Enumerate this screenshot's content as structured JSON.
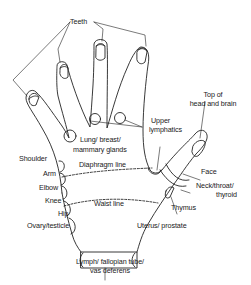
{
  "diagram": {
    "stroke_color": "#222222",
    "background": "#ffffff",
    "labels": {
      "teeth": "Teeth",
      "top_head_1": "Top of",
      "top_head_2": "head and brain",
      "upper_lymph_1": "Upper",
      "upper_lymph_2": "lymphatics",
      "lung_1": "Lung/ breast/",
      "lung_2": "mammary glands",
      "shoulder": "Shoulder",
      "diaphragm": "Diaphragm line",
      "arm": "Arm",
      "face": "Face",
      "elbow": "Elbow",
      "neck_1": "Neck/throat/",
      "neck_2": "thyroid",
      "knee": "Knee",
      "waist": "Waist line",
      "thymus": "Thymus",
      "hip": "Hip",
      "ovary": "Ovary/testicle",
      "uterus": "Uterus/ prostate",
      "lymph_1": "Lymph/ fallopian tube/",
      "lymph_2": "vas deferens"
    }
  }
}
